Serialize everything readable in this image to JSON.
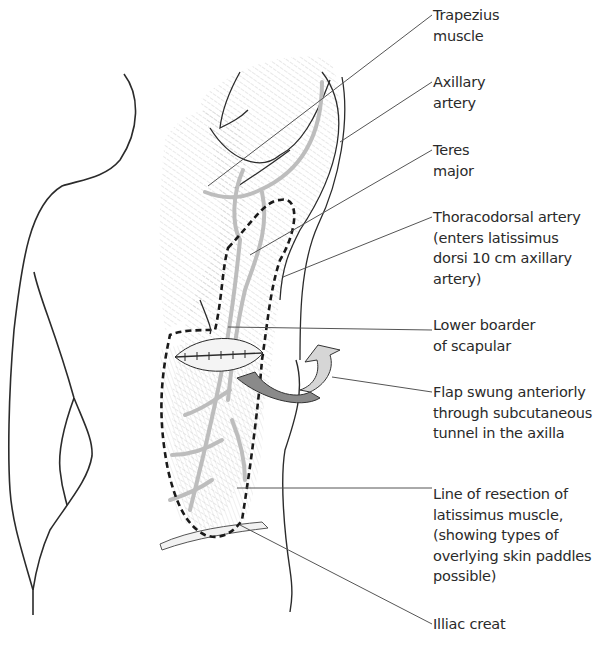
{
  "figure": {
    "colors": {
      "outline": "#2b2b2b",
      "muscle_hatch": "#b9b9b9",
      "vessel": "#bdbdbd",
      "resection_line": "#1a1a1a",
      "arrow_dark": "#8a8a8a",
      "arrow_light": "#d6d6d6",
      "leader": "#555555",
      "text": "#2a2a2a"
    }
  },
  "labels": [
    {
      "id": "trapezius",
      "text": "Trapezius\nmuscle",
      "top": 5
    },
    {
      "id": "axillary",
      "text": "Axillary\nartery",
      "top": 72
    },
    {
      "id": "teres",
      "text": "Teres\nmajor",
      "top": 140
    },
    {
      "id": "thoracodorsal",
      "text": "Thoracodorsal artery\n(enters latissimus\ndorsi 10 cm axillary\nartery)",
      "top": 207
    },
    {
      "id": "scapula",
      "text": "Lower boarder\nof scapular",
      "top": 315
    },
    {
      "id": "flap",
      "text": "Flap swung anteriorly\nthrough subcutaneous\ntunnel in the axilla",
      "top": 382
    },
    {
      "id": "resection",
      "text": "Line of resection of\nlatissimus muscle,\n(showing types of\noverlying skin paddles\npossible)",
      "top": 484
    },
    {
      "id": "iliac",
      "text": "Illiac creat",
      "top": 610
    }
  ]
}
